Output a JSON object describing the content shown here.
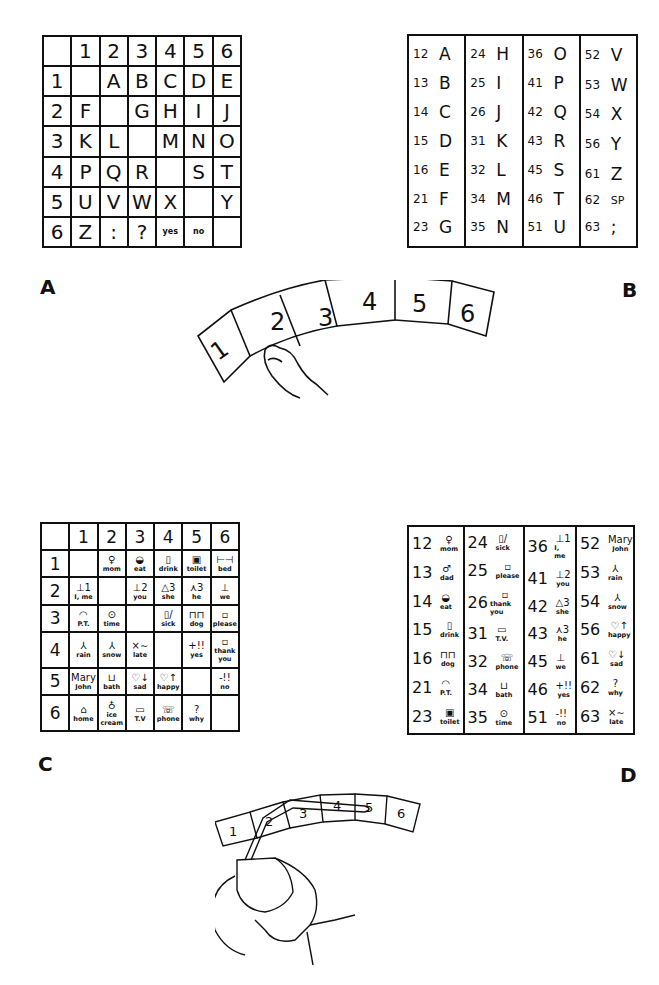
{
  "labels": {
    "a": "A",
    "b": "B",
    "c": "C",
    "d": "D"
  },
  "panel_a": {
    "col_headers": [
      "",
      "1",
      "2",
      "3",
      "4",
      "5",
      "6"
    ],
    "rows": [
      {
        "header": "1",
        "cells": [
          "",
          "A",
          "B",
          "C",
          "D",
          "E"
        ]
      },
      {
        "header": "2",
        "cells": [
          "F",
          "",
          "G",
          "H",
          "I",
          "J"
        ]
      },
      {
        "header": "3",
        "cells": [
          "K",
          "L",
          "",
          "M",
          "N",
          "O"
        ]
      },
      {
        "header": "4",
        "cells": [
          "P",
          "Q",
          "R",
          "",
          "S",
          "T"
        ]
      },
      {
        "header": "5",
        "cells": [
          "U",
          "V",
          "W",
          "X",
          "",
          "Y"
        ]
      },
      {
        "header": "6",
        "cells": [
          "Z",
          ":",
          "?",
          "yes",
          "no",
          ""
        ]
      }
    ]
  },
  "panel_b": {
    "columns": [
      [
        [
          "12",
          "A"
        ],
        [
          "13",
          "B"
        ],
        [
          "14",
          "C"
        ],
        [
          "15",
          "D"
        ],
        [
          "16",
          "E"
        ],
        [
          "21",
          "F"
        ],
        [
          "23",
          "G"
        ]
      ],
      [
        [
          "24",
          "H"
        ],
        [
          "25",
          "I"
        ],
        [
          "26",
          "J"
        ],
        [
          "31",
          "K"
        ],
        [
          "32",
          "L"
        ],
        [
          "34",
          "M"
        ],
        [
          "35",
          "N"
        ]
      ],
      [
        [
          "36",
          "O"
        ],
        [
          "41",
          "P"
        ],
        [
          "42",
          "Q"
        ],
        [
          "43",
          "R"
        ],
        [
          "45",
          "S"
        ],
        [
          "46",
          "T"
        ],
        [
          "51",
          "U"
        ]
      ],
      [
        [
          "52",
          "V"
        ],
        [
          "53",
          "W"
        ],
        [
          "54",
          "X"
        ],
        [
          "56",
          "Y"
        ],
        [
          "61",
          "Z"
        ],
        [
          "62",
          "SP"
        ],
        [
          "63",
          ";"
        ]
      ]
    ]
  },
  "panel_c": {
    "col_headers": [
      "",
      "1",
      "2",
      "3",
      "4",
      "5",
      "6"
    ],
    "rows": [
      {
        "header": "1",
        "cells": [
          [
            "",
            ""
          ],
          [
            "♀",
            "mom"
          ],
          [
            "◒",
            "eat"
          ],
          [
            "▯",
            "drink"
          ],
          [
            "▣",
            "toilet"
          ],
          [
            "⊢⊣",
            "bed"
          ]
        ]
      },
      {
        "header": "2",
        "cells": [
          [
            "⊥1",
            "I, me"
          ],
          [
            "",
            ""
          ],
          [
            "⊥2",
            "you"
          ],
          [
            "△3",
            "she"
          ],
          [
            "⋏3",
            "he"
          ],
          [
            "⊥",
            "we"
          ]
        ]
      },
      {
        "header": "3",
        "cells": [
          [
            "◠",
            "P.T."
          ],
          [
            "⊙",
            "time"
          ],
          [
            "",
            ""
          ],
          [
            "▯/",
            "sick"
          ],
          [
            "⊓⊓",
            "dog"
          ],
          [
            "▫",
            "please"
          ]
        ]
      },
      {
        "header": "4",
        "cells": [
          [
            "⅄",
            "rain"
          ],
          [
            "⅄",
            "snow"
          ],
          [
            "×∼",
            "late"
          ],
          [
            "",
            ""
          ],
          [
            "+!!",
            "yes"
          ],
          [
            "▫",
            "thank you"
          ]
        ]
      },
      {
        "header": "5",
        "cells": [
          [
            "Mary",
            "John"
          ],
          [
            "⊔",
            "bath"
          ],
          [
            "♡↓",
            "sad"
          ],
          [
            "♡↑",
            "happy"
          ],
          [
            "",
            ""
          ],
          [
            "-!!",
            "no"
          ]
        ]
      },
      {
        "header": "6",
        "cells": [
          [
            "⌂",
            "home"
          ],
          [
            "♁",
            "ice cream"
          ],
          [
            "▭",
            "T.V"
          ],
          [
            "☏",
            "phone"
          ],
          [
            "?",
            "why"
          ],
          [
            "",
            ""
          ]
        ]
      }
    ]
  },
  "panel_d": {
    "columns": [
      [
        [
          "12",
          "♀",
          "mom"
        ],
        [
          "13",
          "♂",
          "dad"
        ],
        [
          "14",
          "◒",
          "eat"
        ],
        [
          "15",
          "▯",
          "drink"
        ],
        [
          "16",
          "⊓⊓",
          "dog"
        ],
        [
          "21",
          "◠",
          "P.T."
        ],
        [
          "23",
          "▣",
          "toilet"
        ]
      ],
      [
        [
          "24",
          "▯/",
          "sick"
        ],
        [
          "25",
          "▫",
          "please"
        ],
        [
          "26",
          "▫",
          "thank you"
        ],
        [
          "31",
          "▭",
          "T.V."
        ],
        [
          "32",
          "☏",
          "phone"
        ],
        [
          "34",
          "⊔",
          "bath"
        ],
        [
          "35",
          "⊙",
          "time"
        ]
      ],
      [
        [
          "36",
          "⊥1",
          "I, me"
        ],
        [
          "41",
          "⊥2",
          "you"
        ],
        [
          "42",
          "△3",
          "she"
        ],
        [
          "43",
          "⋏3",
          "he"
        ],
        [
          "45",
          "⊥",
          "we"
        ],
        [
          "46",
          "+!!",
          "yes"
        ],
        [
          "51",
          "-!!",
          "no"
        ]
      ],
      [
        [
          "52",
          "Mary",
          "John"
        ],
        [
          "53",
          "⅄",
          "rain"
        ],
        [
          "54",
          "⅄",
          "snow"
        ],
        [
          "56",
          "♡↑",
          "happy"
        ],
        [
          "61",
          "♡↓",
          "sad"
        ],
        [
          "62",
          "?",
          "why"
        ],
        [
          "63",
          "×∼",
          "late"
        ]
      ]
    ]
  },
  "arc_top": {
    "numbers": [
      "1",
      "2",
      "3",
      "4",
      "5",
      "6"
    ]
  },
  "arc_bottom": {
    "numbers": [
      "1",
      "2",
      "3",
      "4",
      "5",
      "6"
    ]
  }
}
